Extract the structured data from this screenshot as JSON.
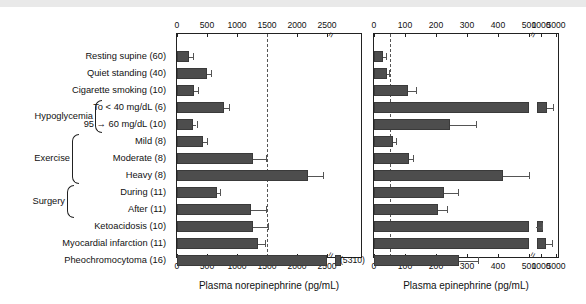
{
  "chart_data": {
    "type": "bar",
    "title": "",
    "orientation": "horizontal",
    "panels": [
      {
        "id": "norepinephrine",
        "xlabel": "Plasma norepinephrine (pg/mL)",
        "ticks": [
          0,
          500,
          1000,
          1500,
          2000,
          2500
        ],
        "ticklabels": [
          "0",
          "500",
          "1000",
          "1500",
          "2000",
          "2500"
        ],
        "axis_break_after": 2500,
        "threshold_line": 1500,
        "xlim": [
          0,
          3000
        ],
        "values": [
          200,
          500,
          290,
          780,
          270,
          440,
          1260,
          2180,
          660,
          1230,
          1270,
          1350,
          3000
        ],
        "errors": [
          60,
          65,
          55,
          90,
          55,
          60,
          230,
          250,
          55,
          250,
          250,
          115,
          0
        ],
        "offscale_labels": [
          "",
          "",
          "",
          "",
          "",
          "",
          "",
          "",
          "",
          "",
          "",
          "",
          "(5310)"
        ]
      },
      {
        "id": "epinephrine",
        "xlabel": "Plasma epinephrine (pg/mL)",
        "ticks": [
          0,
          100,
          200,
          300,
          400,
          500,
          1000,
          5000
        ],
        "ticklabels": [
          "0",
          "100",
          "200",
          "300",
          "400",
          "500",
          "1000",
          "5000"
        ],
        "axis_break_after": 500,
        "threshold_line": 50,
        "xlim": [
          0,
          5000
        ],
        "values": [
          30,
          42,
          110,
          1000,
          245,
          60,
          112,
          415,
          225,
          205,
          510,
          970,
          275
        ],
        "errors": [
          8,
          6,
          25,
          120,
          85,
          10,
          15,
          85,
          45,
          30,
          55,
          95,
          60
        ],
        "offscale_labels": [
          "",
          "",
          "",
          "",
          "",
          "",
          "",
          "",
          "",
          "",
          "",
          "",
          ""
        ]
      }
    ],
    "categories": [
      {
        "label": "Resting supine (60)",
        "group": ""
      },
      {
        "label": "Quiet standing (40)",
        "group": ""
      },
      {
        "label": "Cigarette smoking (10)",
        "group": ""
      },
      {
        "label": "To < 40 mg/dL (6)",
        "group": "Hypoglycemia"
      },
      {
        "label": "95 → 60 mg/dL (10)",
        "group": "Hypoglycemia"
      },
      {
        "label": "Mild (8)",
        "group": "Exercise"
      },
      {
        "label": "Moderate (8)",
        "group": "Exercise"
      },
      {
        "label": "Heavy (8)",
        "group": "Exercise"
      },
      {
        "label": "During (11)",
        "group": "Surgery"
      },
      {
        "label": "After (11)",
        "group": "Surgery"
      },
      {
        "label": "Ketoacidosis (10)",
        "group": ""
      },
      {
        "label": "Myocardial infarction (11)",
        "group": ""
      },
      {
        "label": "Pheochromocytoma (16)",
        "group": ""
      }
    ],
    "group_labels": [
      "Hypoglycemia",
      "Exercise",
      "Surgery"
    ],
    "bar_color": "#4d4d4d",
    "threshold_color": "#555555",
    "grid": false,
    "legend": "none"
  }
}
